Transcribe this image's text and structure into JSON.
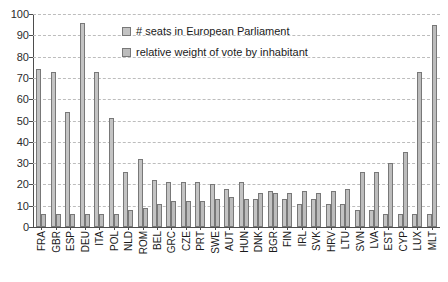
{
  "chart_data": {
    "type": "bar",
    "title": "",
    "xlabel": "",
    "ylabel": "",
    "ylim": [
      0,
      100
    ],
    "yticks": [
      0,
      10,
      20,
      30,
      40,
      50,
      60,
      70,
      80,
      90,
      100
    ],
    "grid": true,
    "legend_position": "top-center",
    "categories": [
      "FRA",
      "GBR",
      "ESP",
      "DEU",
      "ITA",
      "POL",
      "NLD",
      "ROM",
      "BEL",
      "GRC",
      "CZE",
      "PRT",
      "SWE",
      "AUT",
      "HUN",
      "DNK",
      "BGR",
      "FIN",
      "IRL",
      "SVK",
      "HRV",
      "LTU",
      "SVN",
      "LVA",
      "EST",
      "CYP",
      "LUX",
      "MLT"
    ],
    "series": [
      {
        "name": "# seats in European Parliament",
        "color": "#c3c3c3",
        "values": [
          74,
          73,
          54,
          96,
          73,
          51,
          26,
          32,
          22,
          21,
          21,
          21,
          20,
          18,
          21,
          13,
          17,
          13,
          11,
          13,
          11,
          11,
          8,
          8,
          6,
          6,
          6,
          6
        ]
      },
      {
        "name": "relative weight of vote by inhabitant",
        "color": "#bcbcbc",
        "values": [
          6,
          6,
          6,
          6,
          6,
          6,
          8,
          9,
          11,
          12,
          12,
          12,
          13,
          14,
          13,
          16,
          16,
          16,
          17,
          16,
          17,
          18,
          26,
          26,
          30,
          35,
          73,
          95
        ]
      }
    ]
  },
  "legend": {
    "items": [
      {
        "label": "# seats in European Parliament"
      },
      {
        "label": "relative weight of vote by inhabitant"
      }
    ]
  }
}
